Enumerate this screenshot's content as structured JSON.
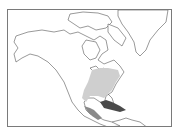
{
  "map": {
    "region": "North America",
    "frame": {
      "x": 7,
      "y": 9,
      "width": 165,
      "height": 118
    },
    "colors": {
      "background": "#ffffff",
      "coastline": "#555555",
      "frame": "#7a7a7a",
      "light_range": "#cfcfcf",
      "medium_range": "#8a8a8a",
      "dark_range": "#4a4a4a"
    },
    "shaded_regions": [
      {
        "name": "eastern-north-america-range",
        "shade": "light"
      },
      {
        "name": "mexico-central-america-range",
        "shade": "medium"
      },
      {
        "name": "caribbean-cuba-range",
        "shade": "dark"
      }
    ]
  }
}
